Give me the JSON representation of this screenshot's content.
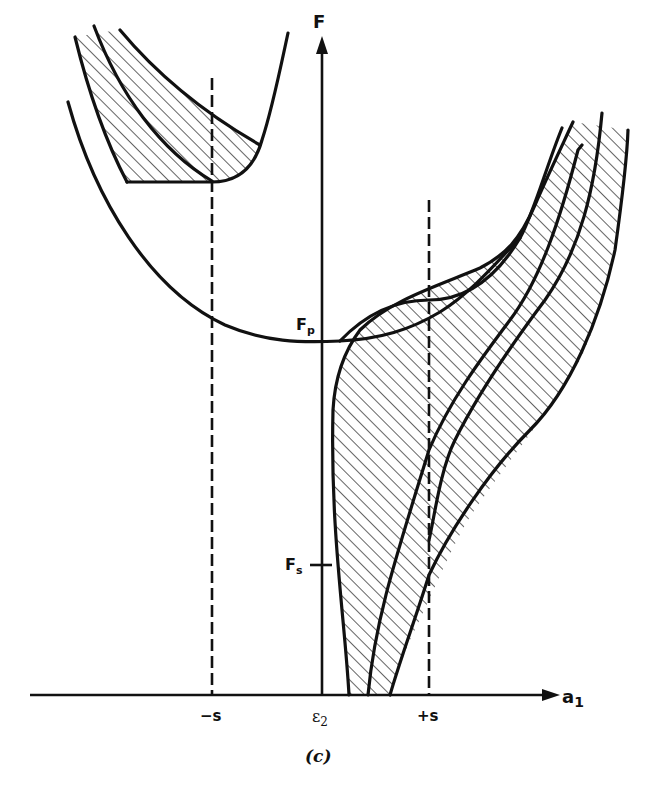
{
  "figure": {
    "caption": "(c)",
    "axes": {
      "y_label": "F",
      "x_label": "a",
      "x_label_sub": "1"
    },
    "x_ticks": [
      {
        "label": "−s",
        "x": 212
      },
      {
        "label": "ε",
        "sub": "2",
        "x": 322
      },
      {
        "label": "+s",
        "x": 429
      }
    ],
    "y_marks": [
      {
        "label": "F",
        "sub": "p",
        "y": 340
      },
      {
        "label": "F",
        "sub": "s",
        "y": 565
      }
    ],
    "dashed_lines": [
      {
        "name": "minus-s",
        "x": 212,
        "y_top": 78,
        "y_bottom": 695
      },
      {
        "name": "plus-s",
        "x": 429,
        "y_top": 200,
        "y_bottom": 695
      }
    ],
    "colors": {
      "ink": "#111111",
      "background": "#ffffff"
    }
  }
}
